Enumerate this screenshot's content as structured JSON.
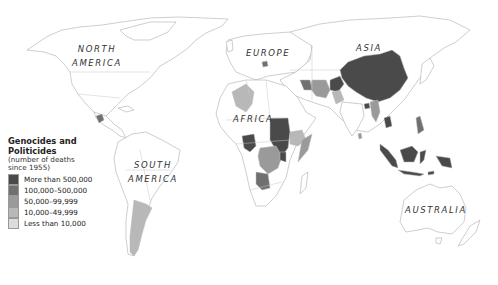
{
  "map": {
    "continent_labels": {
      "north_america": [
        "NORTH",
        "AMERICA"
      ],
      "south_america": [
        "SOUTH",
        "AMERICA"
      ],
      "europe": "EUROPE",
      "africa": "AFRICA",
      "asia": "ASIA",
      "australia": "AUSTRALIA"
    }
  },
  "legend": {
    "title_line1": "Genocides and",
    "title_line2": "Politicides",
    "subtitle_line1": "(number of deaths",
    "subtitle_line2": "since 1955)",
    "items": [
      {
        "label": "More than 500,000",
        "color": "#4a4a4a"
      },
      {
        "label": "100,000–500,000",
        "color": "#707070"
      },
      {
        "label": "50,000–99,999",
        "color": "#9a9a9a"
      },
      {
        "label": "10,000–49,999",
        "color": "#b8b8b8"
      },
      {
        "label": "Less than 10,000",
        "color": "#dcdcdc"
      }
    ]
  }
}
